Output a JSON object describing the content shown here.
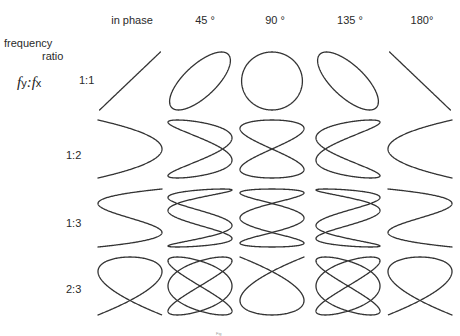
{
  "header": {
    "row_axis_label_line1": "frequency",
    "row_axis_label_line2": "ratio",
    "ratio_symbol": {
      "fy": "f",
      "fy_sub": "y",
      "sep": ":",
      "fx": "f",
      "fx_sub": "x"
    }
  },
  "columns": [
    {
      "label": "in phase",
      "phase_deg": 0,
      "cx": 130
    },
    {
      "label": "45 °",
      "phase_deg": 45,
      "cx": 200
    },
    {
      "label": "90 °",
      "phase_deg": 90,
      "cx": 272
    },
    {
      "label": "135 °",
      "phase_deg": 135,
      "cx": 348
    },
    {
      "label": "180°",
      "phase_deg": 180,
      "cx": 420
    }
  ],
  "rows": [
    {
      "label": "1:1",
      "fy": 1,
      "fx": 1,
      "cy": 81,
      "label_y": 74
    },
    {
      "label": "1:2",
      "fy": 1,
      "fx": 2,
      "cy": 149,
      "label_y": 142
    },
    {
      "label": "1:3",
      "fy": 1,
      "fx": 3,
      "cy": 218,
      "label_y": 211
    },
    {
      "label": "2:3",
      "fy": 2,
      "fx": 3,
      "cy": 286,
      "label_y": 277
    }
  ],
  "footnote": "Fig",
  "colors": {
    "stroke": "#333333",
    "text": "#2a2a2a",
    "background": "#ffffff"
  }
}
